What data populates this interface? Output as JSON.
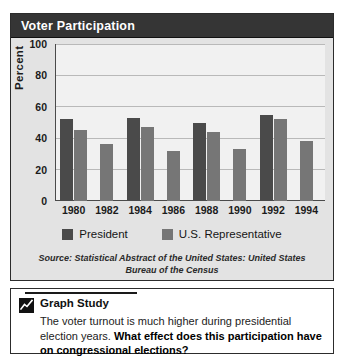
{
  "chart_card": {
    "title": "Voter Participation"
  },
  "chart_data": {
    "type": "bar",
    "title": "Voter Participation",
    "xlabel": "",
    "ylabel": "Percent",
    "ylim": [
      0,
      100
    ],
    "yticks": [
      100,
      80,
      60,
      40,
      20,
      0
    ],
    "grid": true,
    "legend_position": "bottom",
    "categories": [
      "1980",
      "1982",
      "1984",
      "1986",
      "1988",
      "1990",
      "1992",
      "1994"
    ],
    "series": [
      {
        "name": "President",
        "color": "#4a4a4a",
        "values": [
          52,
          null,
          53,
          null,
          50,
          null,
          55,
          null
        ]
      },
      {
        "name": "U.S. Representative",
        "color": "#767676",
        "values": [
          45,
          36,
          47,
          32,
          44,
          33,
          52,
          38
        ]
      }
    ],
    "source": "Source: Statistical Abstract of the United States: United States Bureau of the Census"
  },
  "legend": {
    "items": [
      {
        "label": "President",
        "color": "#4a4a4a"
      },
      {
        "label": "U.S. Representative",
        "color": "#767676"
      }
    ]
  },
  "source_text": {
    "line1": "Source: Statistical Abstract of the United States: United States",
    "line2": "Bureau of the Census"
  },
  "study": {
    "title": "Graph Study",
    "text_plain": "The voter turnout is much higher during presidential election years. ",
    "text_bold": "What effect does this participation have on congressional elections?"
  }
}
